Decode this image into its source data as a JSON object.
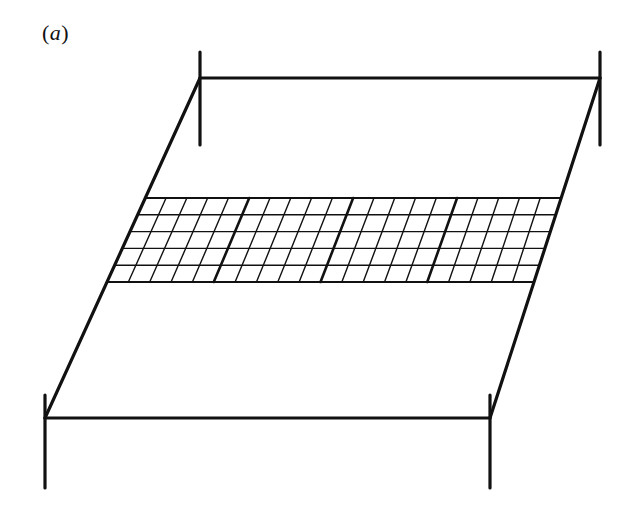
{
  "figure": {
    "panel_label": {
      "open": "(",
      "letter": "a",
      "close": ")"
    },
    "colors": {
      "stroke": "#111111",
      "background": "#ffffff"
    },
    "frame": {
      "top_left": [
        200,
        78
      ],
      "top_right": [
        600,
        78
      ],
      "bottom_left": [
        45,
        418
      ],
      "bottom_right": [
        490,
        418
      ],
      "stroke_width": 3.2,
      "ticks": [
        {
          "x": 200,
          "y1": 52,
          "y2": 145
        },
        {
          "x": 600,
          "y1": 52,
          "y2": 145
        },
        {
          "x": 45,
          "y1": 395,
          "y2": 488
        },
        {
          "x": 490,
          "y1": 395,
          "y2": 488
        }
      ]
    },
    "grid": {
      "top_y": 198,
      "bottom_y": 282,
      "top_left_x": 145.3,
      "top_right_x": 561,
      "bottom_left_x": 107,
      "bottom_right_x": 534,
      "rows": 5,
      "blocks": 4,
      "columns_per_block": 5,
      "thin_stroke_width": 1.4,
      "thick_stroke_width": 2.6,
      "edge_stroke_width": 2.2
    }
  }
}
